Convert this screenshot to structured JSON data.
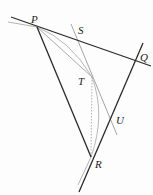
{
  "diagram": {
    "type": "geometry",
    "points": {
      "P": {
        "label": "P",
        "x": 37,
        "y": 27
      },
      "Q": {
        "label": "Q",
        "x": 136,
        "y": 62
      },
      "R": {
        "label": "R",
        "x": 91,
        "y": 157
      },
      "S": {
        "label": "S",
        "x": 77,
        "y": 40
      },
      "T": {
        "label": "T",
        "x": 92,
        "y": 77
      },
      "U": {
        "label": "U",
        "x": 112,
        "y": 118
      }
    },
    "labels": {
      "P": "P",
      "Q": "Q",
      "R": "R",
      "S": "S",
      "T": "T",
      "U": "U"
    },
    "colors": {
      "main_line": "#2a2a2a",
      "construction_line": "#9a9a9a",
      "dotted_line": "#a8a8a8"
    }
  }
}
